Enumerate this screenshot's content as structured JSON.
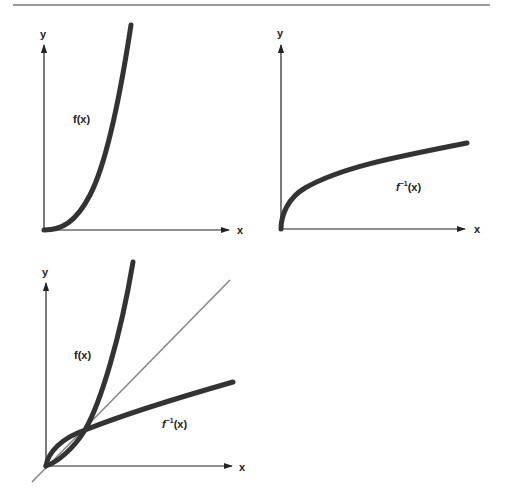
{
  "figure": {
    "top_rule_color": "#777777",
    "curve_color": "#333333",
    "identity_line_color": "#888888",
    "axis_color": "#222222"
  },
  "panels": [
    {
      "id": "f",
      "axis_x_label": "x",
      "axis_y_label": "y",
      "curve_label": "f(x)"
    },
    {
      "id": "f_inverse",
      "axis_x_label": "x",
      "axis_y_label": "y",
      "curve_label_base": "f",
      "curve_label_sup": "−1",
      "curve_label_arg": "(x)"
    },
    {
      "id": "combined",
      "axis_x_label": "x",
      "axis_y_label": "y",
      "curve_label_f": "f(x)",
      "curve_label_inv_base": "f",
      "curve_label_inv_sup": "−1",
      "curve_label_inv_arg": "(x)",
      "identity_line": "y = x"
    }
  ]
}
